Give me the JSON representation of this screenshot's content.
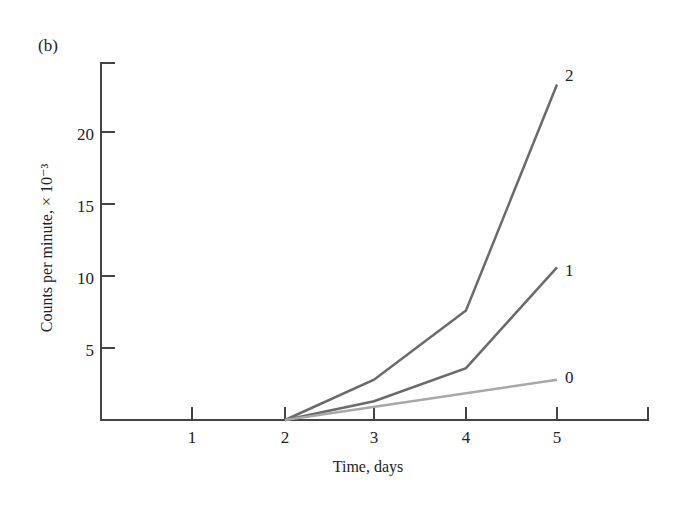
{
  "panel_label": "(b)",
  "chart_data": {
    "type": "line",
    "title": "",
    "xlabel": "Time, days",
    "ylabel": "Counts per minute, × 10⁻³",
    "x_ticks": [
      "1",
      "2",
      "3",
      "4",
      "5"
    ],
    "y_ticks": [
      "5",
      "10",
      "15",
      "20"
    ],
    "xlim": [
      0,
      6
    ],
    "ylim": [
      0,
      25
    ],
    "grid": false,
    "legend": "inline labels at line ends",
    "series": [
      {
        "name": "2",
        "x": [
          2,
          3,
          4,
          5
        ],
        "values": [
          0,
          2.8,
          7.6,
          23.3
        ],
        "color": "#6a6a6a"
      },
      {
        "name": "1",
        "x": [
          2,
          3,
          4,
          5
        ],
        "values": [
          0,
          1.3,
          3.6,
          10.6
        ],
        "color": "#6a6a6a"
      },
      {
        "name": "0",
        "x": [
          2,
          5
        ],
        "values": [
          0,
          2.8
        ],
        "color": "#a8a8a8"
      }
    ]
  },
  "axis_color": "#444444"
}
